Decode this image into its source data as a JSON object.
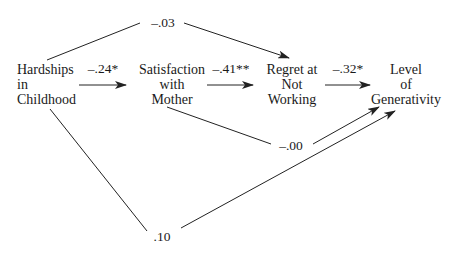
{
  "diagram": {
    "type": "path-diagram",
    "nodes": {
      "hardships": {
        "lines": [
          "Hardships",
          "in",
          "Childhood"
        ]
      },
      "satisfaction": {
        "lines": [
          "Satisfaction",
          "with",
          "Mother"
        ]
      },
      "regret": {
        "lines": [
          "Regret at",
          "Not",
          "Working"
        ]
      },
      "generativity": {
        "lines": [
          "Level",
          "of",
          "Generativity"
        ]
      }
    },
    "paths": [
      {
        "from": "Hardships in Childhood",
        "to": "Satisfaction with Mother",
        "coefficient": "–.24*"
      },
      {
        "from": "Satisfaction with Mother",
        "to": "Regret at Not Working",
        "coefficient": "–.41**"
      },
      {
        "from": "Regret at Not Working",
        "to": "Level of Generativity",
        "coefficient": "–.32*"
      },
      {
        "from": "Hardships in Childhood",
        "to": "Regret at Not Working",
        "coefficient": "–.03"
      },
      {
        "from": "Satisfaction with Mother",
        "to": "Level of Generativity",
        "coefficient": "–.00"
      },
      {
        "from": "Hardships in Childhood",
        "to": "Level of Generativity",
        "coefficient": ".10"
      }
    ],
    "line_color": "#222222"
  }
}
